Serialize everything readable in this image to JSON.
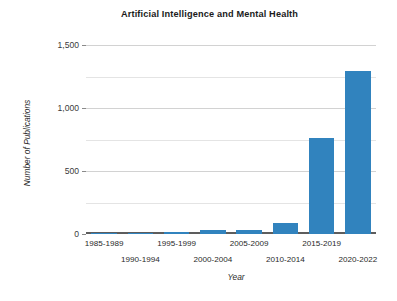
{
  "chart_data": {
    "type": "bar",
    "title": "Artificial Intelligence and Mental Health",
    "xlabel": "Year",
    "ylabel": "Number of Publications",
    "categories": [
      "1985-1989",
      "1990-1994",
      "1995-1999",
      "2000-2004",
      "2005-2009",
      "2010-2014",
      "2015-2019",
      "2020-2022"
    ],
    "values": [
      5,
      12,
      18,
      35,
      35,
      90,
      760,
      1290
    ],
    "ylim": [
      0,
      1500
    ],
    "ytick_labels": [
      "0",
      "500",
      "1,000",
      "1,500"
    ],
    "ytick_values": [
      0,
      500,
      1000,
      1500
    ],
    "minor_gridline_values": [
      250,
      750,
      1250
    ],
    "grid": true,
    "legend": false,
    "bar_color": "#3183be",
    "gridline_color": "#d2d2d2",
    "axis_color": "#5d5d5d",
    "background": "#ffffff"
  }
}
